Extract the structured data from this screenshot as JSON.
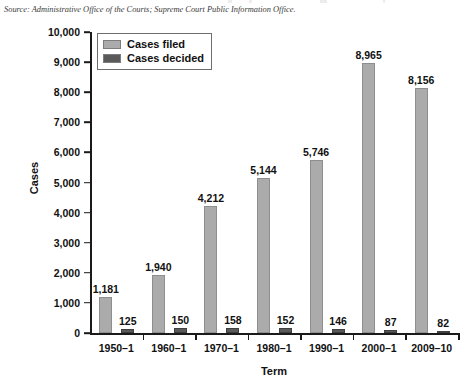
{
  "source_note": "Source: Administrative Office of the Courts; Supreme Court Public Information Office.",
  "legend": {
    "items": [
      {
        "label": "Cases filed",
        "color": "#ababab",
        "swatch_name": "legend-swatch-cases-filed"
      },
      {
        "label": "Cases decided",
        "color": "#5a5a5a",
        "swatch_name": "legend-swatch-cases-decided"
      }
    ]
  },
  "chart_data": {
    "type": "bar",
    "title": "",
    "xlabel": "Term",
    "ylabel": "Cases",
    "categories": [
      "1950–1",
      "1960–1",
      "1970–1",
      "1980–1",
      "1990–1",
      "2000–1",
      "2009–10"
    ],
    "series": [
      {
        "name": "Cases filed",
        "color": "#ababab",
        "values": [
          1181,
          1940,
          4212,
          5144,
          5746,
          8965,
          8156
        ],
        "labels": [
          "1,181",
          "1,940",
          "4,212",
          "5,144",
          "5,746",
          "8,965",
          "8,156"
        ]
      },
      {
        "name": "Cases decided",
        "color": "#5a5a5a",
        "values": [
          125,
          150,
          158,
          152,
          146,
          87,
          82
        ],
        "labels": [
          "125",
          "150",
          "158",
          "152",
          "146",
          "87",
          "82"
        ]
      }
    ],
    "ylim": [
      0,
      10000
    ],
    "ytick_values": [
      0,
      1000,
      2000,
      3000,
      4000,
      5000,
      6000,
      7000,
      8000,
      9000,
      10000
    ],
    "ytick_labels": [
      "0",
      "1,000",
      "2,000",
      "3,000",
      "4,000",
      "5,000",
      "6,000",
      "7,000",
      "8,000",
      "9,000",
      "10,000"
    ],
    "grid": false,
    "legend_position": "upper-left-inside"
  }
}
